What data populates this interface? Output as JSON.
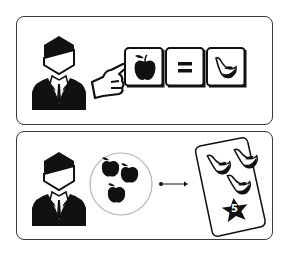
{
  "panels": [
    {
      "id": "exchange-rate",
      "elements": {
        "person": "businessman-icon",
        "pointer": "pointing-hand-icon",
        "tiles": [
          {
            "icon": "apple-icon"
          },
          {
            "label": "="
          },
          {
            "icon": "banana-icon"
          }
        ]
      }
    },
    {
      "id": "trade",
      "elements": {
        "person": "businessman-icon",
        "bag": {
          "icon": "apples-group-icon",
          "count": 4
        },
        "arrow": "arrow-right-icon",
        "card": {
          "bananas": 3,
          "star_value": "5"
        }
      }
    }
  ],
  "colors": {
    "ink": "#111111",
    "border": "#3a3a3a",
    "circle": "#b5b5b5",
    "background": "#ffffff"
  }
}
